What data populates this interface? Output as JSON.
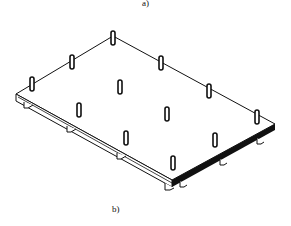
{
  "figure": {
    "label_top": "a)",
    "label_bottom": "b)",
    "stroke_color": "#111111",
    "background": "#ffffff",
    "post_count": 12
  }
}
